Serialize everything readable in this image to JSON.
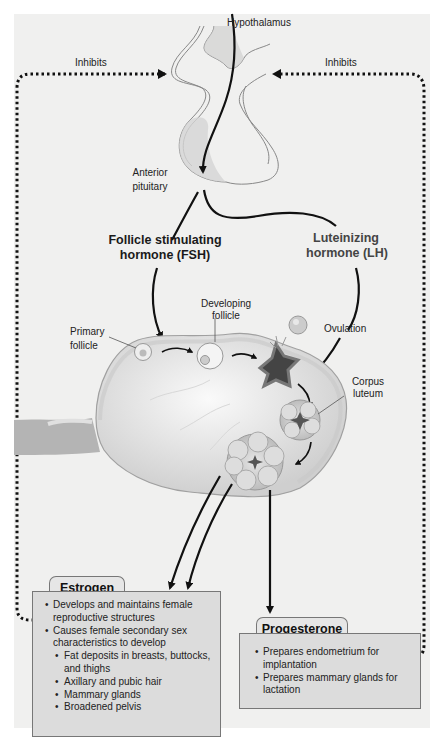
{
  "diagram": {
    "labels": {
      "hypothalamus": "Hypothalamus",
      "inhibits_left": "Inhibits",
      "inhibits_right": "Inhibits",
      "anterior_pituitary_1": "Anterior",
      "anterior_pituitary_2": "pituitary",
      "fsh_1": "Follicle stimulating",
      "fsh_2": "hormone (FSH)",
      "lh_1": "Luteinizing",
      "lh_2": "hormone (LH)",
      "developing_follicle_1": "Developing",
      "developing_follicle_2": "follicle",
      "primary_follicle_1": "Primary",
      "primary_follicle_2": "follicle",
      "ovulation": "Ovulation",
      "corpus_luteum_1": "Corpus",
      "corpus_luteum_2": "luteum"
    },
    "estrogen": {
      "title": "Estrogen",
      "items": [
        {
          "text": "Develops and maintains female reproductive structures",
          "level": 1
        },
        {
          "text": "Causes female secondary sex characteristics to develop",
          "level": 1
        },
        {
          "text": "Fat deposits in breasts, buttocks, and thighs",
          "level": 2
        },
        {
          "text": "Axillary and pubic hair",
          "level": 2
        },
        {
          "text": "Mammary glands",
          "level": 2
        },
        {
          "text": "Broadened pelvis",
          "level": 2
        }
      ]
    },
    "progesterone": {
      "title": "Progesterone",
      "items": [
        {
          "text": "Prepares endometrium for implantation",
          "level": 1
        },
        {
          "text": "Prepares mammary glands for lactation",
          "level": 1
        }
      ]
    },
    "colors": {
      "background": "#f0f0ef",
      "box_fill": "#dcdcdc",
      "arrow": "#111111",
      "tissue": "#d8d8d8"
    }
  }
}
